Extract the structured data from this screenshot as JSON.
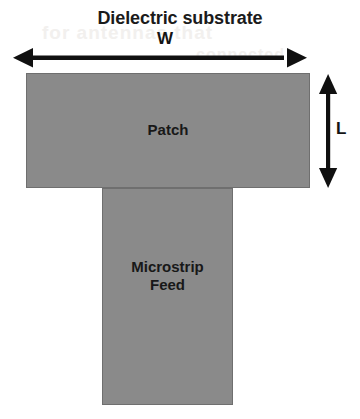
{
  "figure": {
    "title": "Dielectric substrate",
    "background_color": "#ffffff",
    "metal_color": "#8a8a8a",
    "metal_edge_color": "#6f6f6f",
    "ink_color": "#141414"
  },
  "dimensions": {
    "width_label": "W",
    "length_label": "L"
  },
  "shapes": {
    "patch_label": "Patch",
    "feed_label_line1": "Microstrip",
    "feed_label_line2": "Feed"
  },
  "ghosts": {
    "g1": "for antennas that",
    "g2": "connected"
  }
}
